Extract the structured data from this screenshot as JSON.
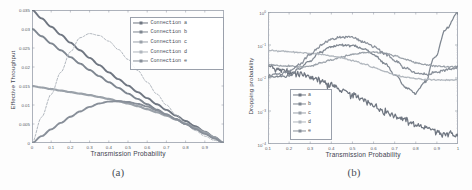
{
  "figure": {
    "background_color": "#fdfdfd",
    "panels": [
      {
        "caption": "(a)",
        "xlabel": "Transmission Probability",
        "ylabel": "Effective Throughput"
      },
      {
        "caption": "(b)",
        "xlabel": "Transmission Probability",
        "ylabel": "Dropping probability"
      }
    ]
  },
  "legend_a": {
    "items": [
      {
        "label": "Connection a",
        "color": "#6f7681",
        "marker": "square"
      },
      {
        "label": "Connection b",
        "color": "#7e8690",
        "marker": "square"
      },
      {
        "label": "Connection c",
        "color": "#9aa1a9",
        "marker": "square"
      },
      {
        "label": "Connection d",
        "color": "#b0b6bd",
        "marker": "square"
      },
      {
        "label": "Connection e",
        "color": "#888f99",
        "marker": "square"
      }
    ]
  },
  "legend_b": {
    "items": [
      {
        "label": "a",
        "color": "#6f7681",
        "marker": "square"
      },
      {
        "label": "b",
        "color": "#7e8690",
        "marker": "square"
      },
      {
        "label": "c",
        "color": "#9aa1a9",
        "marker": "square"
      },
      {
        "label": "d",
        "color": "#b0b6bd",
        "marker": "square"
      },
      {
        "label": "e",
        "color": "#888f99",
        "marker": "square"
      }
    ]
  },
  "chart_data": [
    {
      "type": "line",
      "panel": "(a)",
      "title": "",
      "xlabel": "Transmission Probability",
      "ylabel": "Effective Throughput",
      "xlim": [
        0,
        1
      ],
      "ylim": [
        0,
        0.035
      ],
      "xticks": [
        0,
        0.1,
        0.2,
        0.3,
        0.4,
        0.5,
        0.6,
        0.7,
        0.8,
        0.9
      ],
      "xticklabels": [
        "0",
        "0.1",
        "0.2",
        "0.3",
        "0.4",
        "0.5",
        "0.6",
        "0.7",
        "0.8",
        "0.9"
      ],
      "yticks": [
        0,
        0.005,
        0.01,
        0.015,
        0.02,
        0.025,
        0.03,
        0.035
      ],
      "yticklabels": [
        "0",
        "0.005",
        "0.01",
        "0.015",
        "0.02",
        "0.025",
        "0.03",
        "0.035"
      ],
      "grid": false,
      "legend_position": "upper-right",
      "x": [
        0,
        0.05,
        0.1,
        0.15,
        0.2,
        0.25,
        0.3,
        0.35,
        0.4,
        0.45,
        0.5,
        0.55,
        0.6,
        0.65,
        0.7,
        0.75,
        0.8,
        0.85,
        0.9,
        0.95,
        1.0
      ],
      "series": [
        {
          "name": "Connection a",
          "color": "#6f7681",
          "values": [
            0.035,
            0.0328,
            0.0306,
            0.0285,
            0.0264,
            0.0244,
            0.0224,
            0.0205,
            0.0186,
            0.0168,
            0.0151,
            0.0134,
            0.0118,
            0.0102,
            0.0087,
            0.0072,
            0.0058,
            0.0044,
            0.003,
            0.0015,
            0.0
          ]
        },
        {
          "name": "Connection b",
          "color": "#7e8690",
          "values": [
            0.03,
            0.0281,
            0.0262,
            0.0244,
            0.0226,
            0.0209,
            0.0192,
            0.0176,
            0.016,
            0.0145,
            0.013,
            0.0116,
            0.0102,
            0.0088,
            0.0075,
            0.0062,
            0.005,
            0.0038,
            0.0026,
            0.0013,
            0.0
          ]
        },
        {
          "name": "Connection c",
          "color": "#9aa1a9",
          "values": [
            0.015,
            0.0146,
            0.0142,
            0.0138,
            0.0134,
            0.013,
            0.0126,
            0.0121,
            0.0116,
            0.011,
            0.0104,
            0.0097,
            0.0089,
            0.0081,
            0.0072,
            0.0062,
            0.0051,
            0.004,
            0.0028,
            0.0015,
            0.0
          ]
        },
        {
          "name": "Connection d",
          "color": "#b0b6bd",
          "values": [
            0.0,
            0.0068,
            0.0128,
            0.0186,
            0.024,
            0.0277,
            0.0288,
            0.0283,
            0.0268,
            0.0246,
            0.022,
            0.0191,
            0.016,
            0.0129,
            0.01,
            0.0074,
            0.0052,
            0.0033,
            0.0018,
            0.0007,
            0.0
          ]
        },
        {
          "name": "Connection e",
          "color": "#888f99",
          "values": [
            0.0,
            0.0018,
            0.0036,
            0.0053,
            0.0069,
            0.0083,
            0.0095,
            0.0104,
            0.0109,
            0.011,
            0.0108,
            0.0103,
            0.0096,
            0.0086,
            0.0075,
            0.0063,
            0.005,
            0.0037,
            0.0024,
            0.0012,
            0.0
          ]
        }
      ]
    },
    {
      "type": "line",
      "panel": "(b)",
      "title": "",
      "xlabel": "Transmission Probability",
      "ylabel": "Dropping probability",
      "yscale": "log",
      "xlim": [
        0.1,
        1
      ],
      "ylim": [
        0.0001,
        1
      ],
      "xticks": [
        0.1,
        0.2,
        0.3,
        0.4,
        0.5,
        0.6,
        0.7,
        0.8,
        0.9,
        1.0
      ],
      "xticklabels": [
        "0.1",
        "0.2",
        "0.3",
        "0.4",
        "0.5",
        "0.6",
        "0.7",
        "0.8",
        "0.9",
        "1"
      ],
      "yticks": [
        0.0001,
        0.001,
        0.01,
        0.1,
        1
      ],
      "yticklabels": [
        "10-4",
        "10-3",
        "10-2",
        "10-1",
        "100"
      ],
      "grid": false,
      "legend_position": "lower-left",
      "x": [
        0.1,
        0.15,
        0.2,
        0.25,
        0.3,
        0.35,
        0.4,
        0.45,
        0.5,
        0.55,
        0.6,
        0.65,
        0.7,
        0.75,
        0.8,
        0.85,
        0.9,
        0.95,
        1.0
      ],
      "series": [
        {
          "name": "a",
          "color": "#6f7681",
          "values": [
            0.023,
            0.018,
            0.015,
            0.013,
            0.0105,
            0.0082,
            0.006,
            0.0042,
            0.003,
            0.0021,
            0.0015,
            0.001,
            0.00072,
            0.00052,
            0.00038,
            0.0003,
            0.00024,
            0.0002,
            0.00018
          ]
        },
        {
          "name": "b",
          "color": "#7e8690",
          "values": [
            0.0105,
            0.011,
            0.0115,
            0.019,
            0.033,
            0.06,
            0.088,
            0.1,
            0.095,
            0.078,
            0.052,
            0.028,
            0.012,
            0.0052,
            0.0034,
            0.008,
            0.048,
            0.32,
            0.9
          ]
        },
        {
          "name": "c",
          "color": "#9aa1a9",
          "values": [
            0.025,
            0.024,
            0.023,
            0.022,
            0.023,
            0.028,
            0.035,
            0.043,
            0.052,
            0.058,
            0.06,
            0.056,
            0.047,
            0.037,
            0.029,
            0.025,
            0.023,
            0.022,
            0.022
          ]
        },
        {
          "name": "d",
          "color": "#b0b6bd",
          "values": [
            0.07,
            0.066,
            0.062,
            0.059,
            0.056,
            0.052,
            0.047,
            0.041,
            0.034,
            0.027,
            0.021,
            0.016,
            0.0125,
            0.0105,
            0.0095,
            0.009,
            0.0088,
            0.0087,
            0.0087
          ]
        },
        {
          "name": "e",
          "color": "#888f99",
          "values": [
            0.012,
            0.013,
            0.015,
            0.025,
            0.05,
            0.095,
            0.15,
            0.18,
            0.17,
            0.13,
            0.09,
            0.056,
            0.033,
            0.02,
            0.014,
            0.013,
            0.015,
            0.018,
            0.021
          ]
        }
      ]
    }
  ]
}
